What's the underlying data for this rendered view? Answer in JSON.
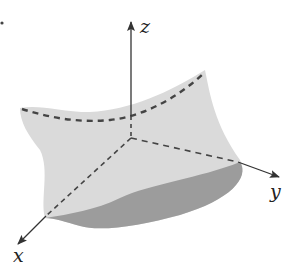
{
  "figure": {
    "axes": {
      "x": {
        "label": "x"
      },
      "y": {
        "label": "y"
      },
      "z": {
        "label": "z"
      }
    },
    "colors": {
      "surface_light": "#d9d9d9",
      "surface_dark": "#9a9a9a",
      "axis_line": "#333333",
      "dashed_line": "#4a4a4a",
      "background": "#ffffff"
    }
  }
}
